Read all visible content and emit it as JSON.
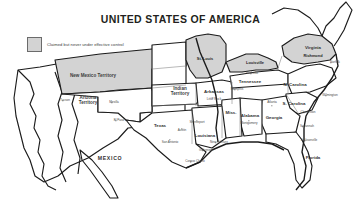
{
  "map": {
    "title": "UNITED STATES OF AMERICA",
    "legend": {
      "swatch_color": "#d3d3d3",
      "label": "Claimed but never under effective control"
    },
    "colors": {
      "claimed_fill": "#d3d3d3",
      "land_fill": "#ffffff",
      "border": "#1b1b1b",
      "inner_border": "#7d7d7d",
      "background": "#ffffff"
    },
    "territories": [
      {
        "name": "New Mexico Territory",
        "x": 93,
        "y": 76,
        "claimed": true
      },
      {
        "name": "Arizona\nTerritory",
        "x": 88,
        "y": 101,
        "claimed": false
      },
      {
        "name": "Indian\nTerritory",
        "x": 180,
        "y": 92,
        "claimed": false
      }
    ],
    "states": [
      {
        "name": "Texas",
        "x": 160,
        "y": 126
      },
      {
        "name": "Arkansas",
        "x": 214,
        "y": 92
      },
      {
        "name": "Louisiana",
        "x": 205,
        "y": 136
      },
      {
        "name": "Miss.",
        "x": 231,
        "y": 113
      },
      {
        "name": "Alabama",
        "x": 250,
        "y": 116
      },
      {
        "name": "Georgia",
        "x": 274,
        "y": 118
      },
      {
        "name": "Tennessee",
        "x": 250,
        "y": 82
      },
      {
        "name": "N. Carolina",
        "x": 295,
        "y": 85
      },
      {
        "name": "S. Carolina",
        "x": 294,
        "y": 104
      },
      {
        "name": "Virginia",
        "x": 313,
        "y": 48
      },
      {
        "name": "Florida",
        "x": 313,
        "y": 158
      }
    ],
    "countries": [
      {
        "name": "MEXICO",
        "x": 110,
        "y": 159
      }
    ],
    "cities_major": [
      {
        "name": "St. Louis",
        "x": 205,
        "y": 59
      },
      {
        "name": "Louisville",
        "x": 255,
        "y": 63
      },
      {
        "name": "Richmond",
        "x": 313,
        "y": 56
      }
    ],
    "cities": [
      {
        "name": "Nashville",
        "x": 252,
        "y": 74,
        "dx": 250.5,
        "dy": 74
      },
      {
        "name": "Memphis",
        "x": 237,
        "y": 90,
        "dx": 235,
        "dy": 90
      },
      {
        "name": "Little Rock",
        "x": 214,
        "y": 100,
        "dx": 213,
        "dy": 98
      },
      {
        "name": "Montgomery",
        "x": 249,
        "y": 124,
        "dx": 249,
        "dy": 121
      },
      {
        "name": "Atlanta",
        "x": 272,
        "y": 103,
        "dx": 272,
        "dy": 106
      },
      {
        "name": "Charleston",
        "x": 308,
        "y": 113,
        "dx": 304,
        "dy": 113
      },
      {
        "name": "Savannah",
        "x": 307,
        "y": 127,
        "dx": 303,
        "dy": 127
      },
      {
        "name": "Jacksonville",
        "x": 309,
        "y": 141,
        "dx": 305,
        "dy": 141
      },
      {
        "name": "Wilmington",
        "x": 330,
        "y": 96,
        "dx": 326,
        "dy": 96
      },
      {
        "name": "Norfolk",
        "x": 335,
        "y": 63,
        "dx": 331,
        "dy": 63
      },
      {
        "name": "Shreveport",
        "x": 197,
        "y": 123,
        "dx": 197,
        "dy": 121
      },
      {
        "name": "New Orleans",
        "x": 219,
        "y": 143,
        "dx": 216,
        "dy": 143
      },
      {
        "name": "Galveston",
        "x": 206,
        "y": 151,
        "dx": 203,
        "dy": 151
      },
      {
        "name": "Corpus Christi",
        "x": 195,
        "y": 162,
        "dx": 191,
        "dy": 162
      },
      {
        "name": "San Antonio",
        "x": 170,
        "y": 143,
        "dx": 170,
        "dy": 140
      },
      {
        "name": "Austin",
        "x": 182,
        "y": 131,
        "dx": 182,
        "dy": 129
      },
      {
        "name": "El Paso",
        "x": 119,
        "y": 121,
        "dx": 116,
        "dy": 121
      },
      {
        "name": "Mesilla",
        "x": 114,
        "y": 103,
        "dx": 112,
        "dy": 103
      },
      {
        "name": "Tucson",
        "x": 65,
        "y": 101,
        "dx": 63,
        "dy": 101
      }
    ]
  }
}
